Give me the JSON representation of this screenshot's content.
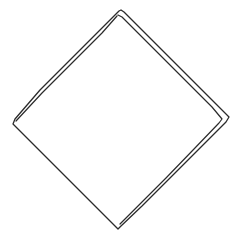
{
  "drawing": {
    "subject": "diamond",
    "description": "Hand-drawn sketch of a rotated square (diamond) outlined with doubled pencil lines",
    "style": "sketch",
    "colors": {
      "background": "#ffffff",
      "line": "#2b2b2b"
    }
  }
}
